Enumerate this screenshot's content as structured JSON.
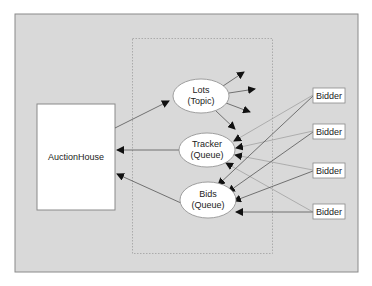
{
  "diagram": {
    "colors": {
      "background": "#ffffff",
      "canvas": "#d9d9d9",
      "canvas_border": "#8a8a8a",
      "box_fill": "#ffffff",
      "box_stroke": "#8a8a8a",
      "line": "#555555",
      "faint_line": "#9a9a9a",
      "arrowhead": "#111111"
    },
    "auction_house": {
      "label": "AuctionHouse"
    },
    "lots": {
      "name": "Lots",
      "kind": "(Topic)"
    },
    "tracker": {
      "name": "Tracker",
      "kind": "(Queue)"
    },
    "bids": {
      "name": "Bids",
      "kind": "(Queue)"
    },
    "bidders": [
      {
        "label": "Bidder"
      },
      {
        "label": "Bidder"
      },
      {
        "label": "Bidder"
      },
      {
        "label": "Bidder"
      }
    ],
    "edges": [
      {
        "from": "AuctionHouse",
        "to": "Lots"
      },
      {
        "from": "Tracker",
        "to": "AuctionHouse"
      },
      {
        "from": "Bids",
        "to": "AuctionHouse"
      },
      {
        "from": "Lots",
        "to": "subscribers",
        "count": 4
      },
      {
        "from": "Bidder 1",
        "to": "Tracker"
      },
      {
        "from": "Bidder 1",
        "to": "Bids"
      },
      {
        "from": "Bidder 2",
        "to": "Tracker"
      },
      {
        "from": "Bidder 2",
        "to": "Bids"
      },
      {
        "from": "Bidder 3",
        "to": "Tracker"
      },
      {
        "from": "Bidder 3",
        "to": "Bids"
      },
      {
        "from": "Bidder 4",
        "to": "Tracker"
      },
      {
        "from": "Bidder 4",
        "to": "Bids"
      }
    ]
  }
}
